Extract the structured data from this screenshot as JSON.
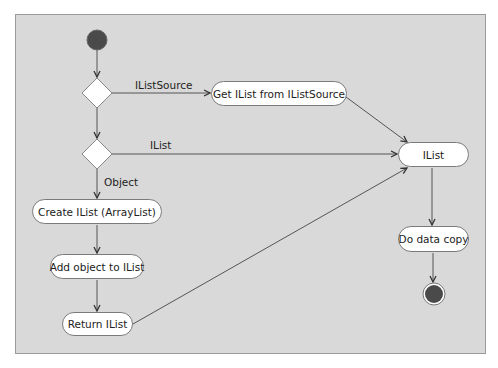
{
  "diagram": {
    "type": "activity",
    "nodes": {
      "get_ilist": "Get IList from IListSource",
      "ilist": "IList",
      "create_ilist": "Create IList (ArrayList)",
      "add_object": "Add object to IList",
      "return_ilist": "Return IList",
      "data_copy": "Do data copy"
    },
    "edge_labels": {
      "ilistsource": "IListSource",
      "ilist": "IList",
      "object": "Object"
    },
    "colors": {
      "background": "#d9d9d9",
      "node_fill": "#ffffff",
      "terminal_fill": "#4a4a4a",
      "line": "#555555"
    }
  }
}
